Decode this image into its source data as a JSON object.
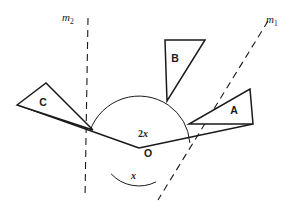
{
  "diagram": {
    "background_color": "#ffffff",
    "stroke_color": "#1a1a1a",
    "width": 298,
    "height": 217,
    "vertex": {
      "name": "O",
      "label": "O",
      "x": 139,
      "y": 148
    },
    "lines": [
      {
        "name": "m2",
        "label": "m",
        "subscript": "2",
        "style": "dashed",
        "label_x": 68,
        "label_y": 18,
        "from": {
          "x": 88,
          "y": 18
        },
        "to": {
          "x": 85,
          "y": 198
        }
      },
      {
        "name": "m1",
        "label": "m",
        "subscript": "1",
        "style": "dashed",
        "label_x": 270,
        "label_y": 20,
        "from": {
          "x": 268,
          "y": 21
        },
        "to": {
          "x": 158,
          "y": 200
        }
      }
    ],
    "rays": [
      {
        "name": "ray-left",
        "style": "solid",
        "from": {
          "x": 139,
          "y": 148
        },
        "to": {
          "x": 18,
          "y": 105
        }
      },
      {
        "name": "ray-right",
        "style": "solid",
        "from": {
          "x": 139,
          "y": 148
        },
        "to": {
          "x": 253,
          "y": 124
        }
      }
    ],
    "angles": [
      {
        "name": "angle-2x",
        "label": "2x",
        "coefficient": "2",
        "variable": "x",
        "label_x": 145,
        "label_y": 135,
        "arc_radius": 52,
        "description": "angle between left solid ray and line m1"
      },
      {
        "name": "angle-small-upper",
        "label": "",
        "arc_radius": 52,
        "description": "small arc between line m1 and right solid ray"
      },
      {
        "name": "angle-x",
        "label": "x",
        "variable": "x",
        "label_x": 134,
        "label_y": 176,
        "arc_radius": 38,
        "description": "angle below O between downward extensions of m2 and m1"
      }
    ],
    "triangles": [
      {
        "name": "triangle-A",
        "label": "A",
        "label_x": 234,
        "label_y": 114,
        "points": "250,89 253,124 189,124",
        "description": "right triangle, right angle at lower-right, to the right of vertex O"
      },
      {
        "name": "triangle-B",
        "label": "B",
        "label_x": 175,
        "label_y": 62,
        "points": "165,40 205,40 167,101",
        "description": "right triangle, right angle at upper-left, above vertex O"
      },
      {
        "name": "triangle-C",
        "label": "C",
        "label_x": 43,
        "label_y": 106,
        "points": "17,105 46,83 93,130",
        "description": "scalene triangle at upper-left, left of vertex O"
      }
    ]
  }
}
